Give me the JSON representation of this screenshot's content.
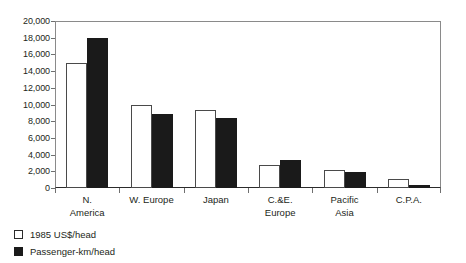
{
  "chart_data": {
    "type": "bar",
    "title": "",
    "subtitle": "",
    "xlabel": "",
    "ylabel": "",
    "ylim": [
      0,
      20000
    ],
    "ytick_step": 2000,
    "ytick_labels": [
      "20,000",
      "18,000",
      "16,000",
      "14,000",
      "12,000",
      "10,000",
      "8,000",
      "6,000",
      "4,000",
      "2,000",
      "0"
    ],
    "ytick_values": [
      20000,
      18000,
      16000,
      14000,
      12000,
      10000,
      8000,
      6000,
      4000,
      2000,
      0
    ],
    "grid": false,
    "legend_position": "below-left",
    "categories": [
      {
        "label": "N.",
        "line2": "America"
      },
      {
        "label": "W. Europe",
        "line2": ""
      },
      {
        "label": "Japan",
        "line2": ""
      },
      {
        "label": "C.&E.",
        "line2": "Europe"
      },
      {
        "label": "Pacific",
        "line2": "Asia"
      },
      {
        "label": "C.P.A.",
        "line2": ""
      }
    ],
    "series": [
      {
        "name": "1985 US$/head",
        "color": "#ffffff",
        "edge_color": "#4a4a4a",
        "values": [
          15000,
          9900,
          9400,
          2800,
          2200,
          1100
        ]
      },
      {
        "name": "Passenger-km/head",
        "color": "#1a1a1a",
        "edge_color": "#1a1a1a",
        "values": [
          18000,
          8900,
          8400,
          3300,
          1900,
          400
        ]
      }
    ]
  },
  "legend": {
    "items": [
      {
        "label": "1985 US$/head",
        "swatch": "light"
      },
      {
        "label": "Passenger-km/head",
        "swatch": "dark"
      }
    ]
  }
}
